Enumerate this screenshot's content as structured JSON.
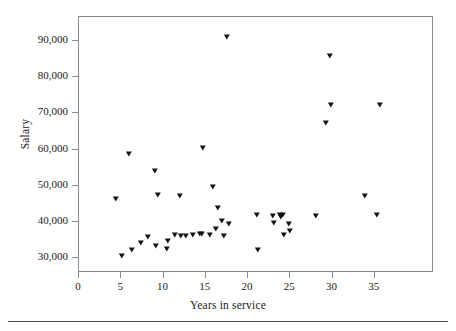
{
  "figure": {
    "y_axis_title": "Salary",
    "x_axis_title": "Years in service"
  },
  "chart_data": {
    "type": "scatter",
    "title": "",
    "xlabel": "Years in service",
    "ylabel": "Salary",
    "xlim": [
      0,
      42
    ],
    "ylim": [
      26000,
      96500
    ],
    "xticks": [
      0,
      5,
      10,
      15,
      20,
      25,
      30,
      35
    ],
    "xtick_labels": [
      "0",
      "5",
      "10",
      "15",
      "20",
      "25",
      "30",
      "35"
    ],
    "yticks": [
      30000,
      40000,
      50000,
      60000,
      70000,
      80000,
      90000
    ],
    "ytick_labels": [
      "30,000",
      "40,000",
      "50,000",
      "60,000",
      "70,000",
      "80,000",
      "90,000"
    ],
    "grid": false,
    "legend": null,
    "marker": "triangle-down",
    "marker_color": "#141414",
    "points": [
      {
        "x": 4.4,
        "y": 46500
      },
      {
        "x": 5.1,
        "y": 30700
      },
      {
        "x": 5.9,
        "y": 58700
      },
      {
        "x": 6.3,
        "y": 32400
      },
      {
        "x": 7.3,
        "y": 34300
      },
      {
        "x": 8.2,
        "y": 36000
      },
      {
        "x": 9.0,
        "y": 54000
      },
      {
        "x": 9.1,
        "y": 33500
      },
      {
        "x": 9.3,
        "y": 47500
      },
      {
        "x": 10.4,
        "y": 32700
      },
      {
        "x": 10.5,
        "y": 34900
      },
      {
        "x": 11.4,
        "y": 36400
      },
      {
        "x": 11.9,
        "y": 47200
      },
      {
        "x": 12.1,
        "y": 36200
      },
      {
        "x": 12.6,
        "y": 36300
      },
      {
        "x": 13.5,
        "y": 36500
      },
      {
        "x": 14.3,
        "y": 36700
      },
      {
        "x": 14.5,
        "y": 36700
      },
      {
        "x": 14.7,
        "y": 60500
      },
      {
        "x": 15.5,
        "y": 36600
      },
      {
        "x": 15.8,
        "y": 49700
      },
      {
        "x": 16.2,
        "y": 38200
      },
      {
        "x": 16.5,
        "y": 44000
      },
      {
        "x": 16.9,
        "y": 40400
      },
      {
        "x": 17.1,
        "y": 36300
      },
      {
        "x": 17.5,
        "y": 91000
      },
      {
        "x": 17.8,
        "y": 39400
      },
      {
        "x": 21.1,
        "y": 41900
      },
      {
        "x": 21.2,
        "y": 32400
      },
      {
        "x": 23.0,
        "y": 41800
      },
      {
        "x": 23.1,
        "y": 39800
      },
      {
        "x": 23.8,
        "y": 42000
      },
      {
        "x": 23.9,
        "y": 41300
      },
      {
        "x": 24.1,
        "y": 41900
      },
      {
        "x": 24.3,
        "y": 36600
      },
      {
        "x": 24.8,
        "y": 39500
      },
      {
        "x": 25.0,
        "y": 37600
      },
      {
        "x": 28.0,
        "y": 41600
      },
      {
        "x": 29.2,
        "y": 67300
      },
      {
        "x": 29.7,
        "y": 85800
      },
      {
        "x": 29.8,
        "y": 72400
      },
      {
        "x": 33.8,
        "y": 47300
      },
      {
        "x": 35.2,
        "y": 41900
      },
      {
        "x": 35.6,
        "y": 72300
      }
    ]
  }
}
